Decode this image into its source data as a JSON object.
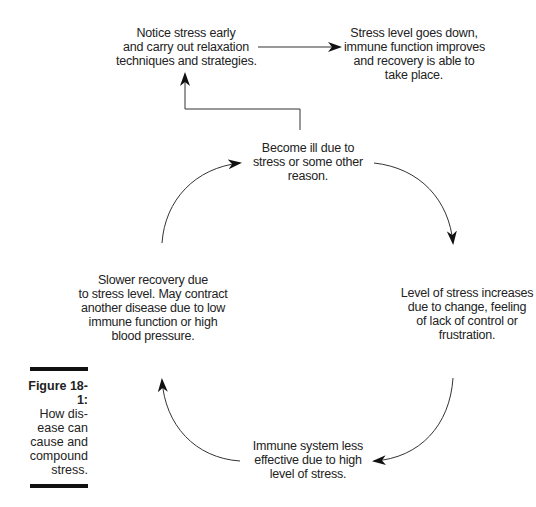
{
  "figure": {
    "label": "Figure 18-1:",
    "caption_lines": [
      "How dis-",
      "ease can",
      "cause and",
      "compound",
      "stress."
    ]
  },
  "nodes": {
    "notice": {
      "lines": [
        "Notice stress early",
        "and carry out relaxation",
        "techniques and strategies."
      ]
    },
    "recovery": {
      "lines": [
        "Stress level goes down,",
        "immune function improves",
        "and recovery is able to",
        "take place."
      ]
    },
    "ill": {
      "lines": [
        "Become ill due to",
        "stress or some other",
        "reason."
      ]
    },
    "stress_up": {
      "lines": [
        "Level of stress increases",
        "due to change, feeling",
        "of lack of control or",
        "frustration."
      ]
    },
    "immune": {
      "lines": [
        "Immune system less",
        "effective due to  high",
        "level of stress."
      ]
    },
    "slower": {
      "lines": [
        "Slower recovery due",
        "to stress level. May contract",
        "another disease due to low",
        "immune function or high",
        "blood pressure."
      ]
    }
  },
  "colors": {
    "line": "#333333",
    "text": "#222222",
    "bar": "#111111"
  }
}
